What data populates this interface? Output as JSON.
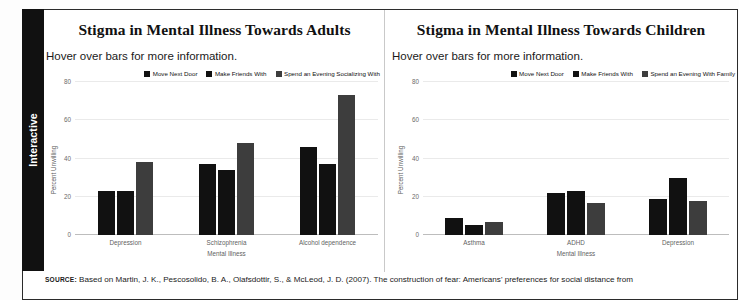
{
  "side_tab": {
    "label": "Interactive"
  },
  "colors": {
    "series_1": "#111111",
    "series_2": "#111111",
    "series_3": "#3d3d3d",
    "gridline": "#eaeaea",
    "axis": "#bdbdbd",
    "tab_background": "#111111",
    "tab_text": "#ffffff"
  },
  "charts": [
    {
      "title": "Stigma in Mental Illness Towards Adults",
      "subtitle": "Hover over bars for more information."
    },
    {
      "title": "Stigma in Mental Illness Towards Children",
      "subtitle": "Hover over bars for more information."
    }
  ],
  "source": {
    "label": "SOURCE:",
    "text": " Based on Martin, J. K., Pescosolido, B. A., Olafsdottir, S., & McLeod, J. D. (2007). The construction of fear: Americans' preferences for social distance from"
  },
  "chart_data": [
    {
      "type": "bar",
      "title": "Stigma in Mental Illness Towards Adults",
      "subtitle": "Hover over bars for more information.",
      "xlabel": "Mental Illness",
      "ylabel": "Percent Unwilling",
      "ylim": [
        0,
        80
      ],
      "yticks": [
        0,
        20,
        40,
        60,
        80
      ],
      "grid": true,
      "legend_position": "top-right",
      "categories": [
        "Depression",
        "Schizophrenia",
        "Alcohol dependence"
      ],
      "series": [
        {
          "name": "Move Next Door",
          "values": [
            23,
            37,
            46
          ]
        },
        {
          "name": "Make Friends With",
          "values": [
            23,
            34,
            37
          ]
        },
        {
          "name": "Spend an Evening Socializing With",
          "values": [
            38,
            48,
            73
          ]
        }
      ]
    },
    {
      "type": "bar",
      "title": "Stigma in Mental Illness Towards Children",
      "subtitle": "Hover over bars for more information.",
      "xlabel": "Mental Illness",
      "ylabel": "Percent Unwilling",
      "ylim": [
        0,
        80
      ],
      "yticks": [
        0,
        20,
        40,
        60,
        80
      ],
      "grid": true,
      "legend_position": "top-right",
      "categories": [
        "Asthma",
        "ADHD",
        "Depression"
      ],
      "series": [
        {
          "name": "Move Next Door",
          "values": [
            9,
            22,
            19
          ]
        },
        {
          "name": "Make Friends With",
          "values": [
            5,
            23,
            30
          ]
        },
        {
          "name": "Spend an Evening With Family",
          "values": [
            7,
            17,
            18
          ]
        }
      ]
    }
  ]
}
